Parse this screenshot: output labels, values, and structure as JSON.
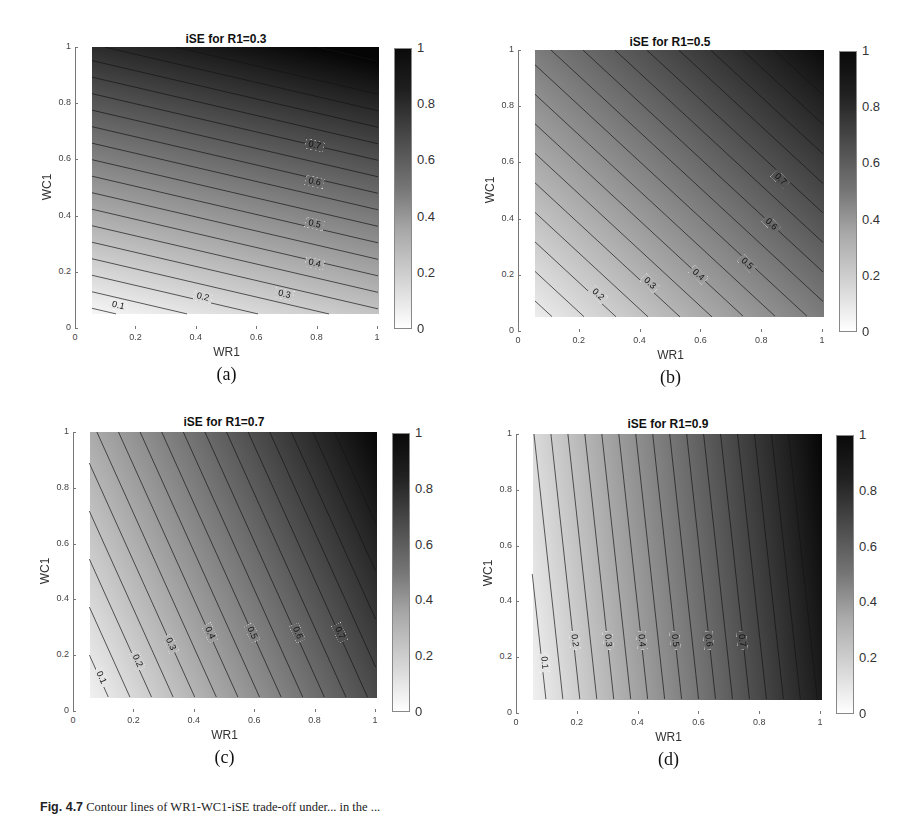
{
  "figure": {
    "caption_label": "Fig. 4.7",
    "caption_text": "Contour lines of WR1-WC1-iSE trade-off under... in the ..."
  },
  "chart_data": [
    {
      "type": "heatmap",
      "subtype": "filled-contour",
      "title": "iSE for R1=0.3",
      "subcaption": "(a)",
      "xlabel": "WR1",
      "ylabel": "WC1",
      "xlim": [
        0,
        1
      ],
      "ylim": [
        0,
        1
      ],
      "data_domain": {
        "x": [
          0.05,
          1
        ],
        "y": [
          0.05,
          1
        ]
      },
      "xticks": [
        "0",
        "0.2",
        "0.4",
        "0.6",
        "0.8",
        "1"
      ],
      "yticks": [
        "0",
        "0.2",
        "0.4",
        "0.6",
        "0.8",
        "1"
      ],
      "colorbar": {
        "range": [
          0,
          1
        ],
        "ticks": [
          "0",
          "0.2",
          "0.4",
          "0.6",
          "0.8",
          "1"
        ],
        "colormap": "gray-reversed"
      },
      "contour_step": 0.05,
      "contour_labels": [
        {
          "level": "0.1",
          "x": 0.14,
          "y": 0.08
        },
        {
          "level": "0.2",
          "x": 0.42,
          "y": 0.11
        },
        {
          "level": "0.3",
          "x": 0.69,
          "y": 0.12
        },
        {
          "level": "0.4",
          "x": 0.79,
          "y": 0.23
        },
        {
          "level": "0.5",
          "x": 0.79,
          "y": 0.37
        },
        {
          "level": "0.6",
          "x": 0.79,
          "y": 0.52
        },
        {
          "level": "0.7",
          "x": 0.79,
          "y": 0.65
        }
      ],
      "approx_model": {
        "a_WR1": 0.213,
        "b_WC1": 0.851,
        "c": -0.021
      }
    },
    {
      "type": "heatmap",
      "subtype": "filled-contour",
      "title": "iSE for R1=0.5",
      "subcaption": "(b)",
      "xlabel": "WR1",
      "ylabel": "WC1",
      "xlim": [
        0,
        1
      ],
      "ylim": [
        0,
        1
      ],
      "data_domain": {
        "x": [
          0.05,
          1
        ],
        "y": [
          0.05,
          1
        ]
      },
      "xticks": [
        "0",
        "0.2",
        "0.4",
        "0.6",
        "0.8",
        "1"
      ],
      "yticks": [
        "0",
        "0.2",
        "0.4",
        "0.6",
        "0.8",
        "1"
      ],
      "colorbar": {
        "range": [
          0,
          1
        ],
        "ticks": [
          "0",
          "0.2",
          "0.4",
          "0.6",
          "0.8",
          "1"
        ],
        "colormap": "gray-reversed"
      },
      "contour_step": 0.05,
      "contour_labels": [
        {
          "level": "0.2",
          "x": 0.26,
          "y": 0.13
        },
        {
          "level": "0.3",
          "x": 0.43,
          "y": 0.17
        },
        {
          "level": "0.4",
          "x": 0.59,
          "y": 0.2
        },
        {
          "level": "0.5",
          "x": 0.75,
          "y": 0.24
        },
        {
          "level": "0.6",
          "x": 0.83,
          "y": 0.38
        },
        {
          "level": "0.7",
          "x": 0.86,
          "y": 0.54
        }
      ],
      "approx_model": {
        "a_WR1": 0.476,
        "b_WC1": 0.476,
        "c": 0.024
      }
    },
    {
      "type": "heatmap",
      "subtype": "filled-contour",
      "title": "iSE for R1=0.7",
      "subcaption": "(c)",
      "xlabel": "WR1",
      "ylabel": "WC1",
      "xlim": [
        0,
        1
      ],
      "ylim": [
        0,
        1
      ],
      "data_domain": {
        "x": [
          0.05,
          1
        ],
        "y": [
          0.05,
          1
        ]
      },
      "xticks": [
        "0",
        "0.2",
        "0.4",
        "0.6",
        "0.8",
        "1"
      ],
      "yticks": [
        "0",
        "0.2",
        "0.4",
        "0.6",
        "0.8",
        "1"
      ],
      "colorbar": {
        "range": [
          0,
          1
        ],
        "ticks": [
          "0",
          "0.2",
          "0.4",
          "0.6",
          "0.8",
          "1"
        ],
        "colormap": "gray-reversed"
      },
      "contour_step": 0.05,
      "contour_labels": [
        {
          "level": "0.1",
          "x": 0.09,
          "y": 0.12
        },
        {
          "level": "0.2",
          "x": 0.21,
          "y": 0.18
        },
        {
          "level": "0.3",
          "x": 0.32,
          "y": 0.24
        },
        {
          "level": "0.4",
          "x": 0.45,
          "y": 0.28
        },
        {
          "level": "0.5",
          "x": 0.59,
          "y": 0.28
        },
        {
          "level": "0.6",
          "x": 0.74,
          "y": 0.28
        },
        {
          "level": "0.7",
          "x": 0.88,
          "y": 0.28
        }
      ],
      "approx_model": {
        "a_WR1": 0.699,
        "b_WC1": 0.291,
        "c": 0.006
      }
    },
    {
      "type": "heatmap",
      "subtype": "filled-contour",
      "title": "iSE for R1=0.9",
      "subcaption": "(d)",
      "xlabel": "WR1",
      "ylabel": "WC1",
      "xlim": [
        0,
        1
      ],
      "ylim": [
        0,
        1
      ],
      "data_domain": {
        "x": [
          0.05,
          1
        ],
        "y": [
          0.05,
          1
        ]
      },
      "xticks": [
        "0",
        "0.2",
        "0.4",
        "0.6",
        "0.8",
        "1"
      ],
      "yticks": [
        "0",
        "0.2",
        "0.4",
        "0.6",
        "0.8",
        "1"
      ],
      "colorbar": {
        "range": [
          0,
          1
        ],
        "ticks": [
          "0",
          "0.2",
          "0.4",
          "0.6",
          "0.8",
          "1"
        ],
        "colormap": "gray-reversed"
      },
      "contour_step": 0.05,
      "contour_labels": [
        {
          "level": "0.1",
          "x": 0.09,
          "y": 0.18
        },
        {
          "level": "0.2",
          "x": 0.19,
          "y": 0.26
        },
        {
          "level": "0.3",
          "x": 0.3,
          "y": 0.26
        },
        {
          "level": "0.4",
          "x": 0.41,
          "y": 0.26
        },
        {
          "level": "0.5",
          "x": 0.52,
          "y": 0.26
        },
        {
          "level": "0.6",
          "x": 0.63,
          "y": 0.26
        },
        {
          "level": "0.7",
          "x": 0.74,
          "y": 0.26
        }
      ],
      "approx_model": {
        "a_WR1": 0.896,
        "b_WC1": 0.0896,
        "c": 0.0104
      }
    }
  ]
}
